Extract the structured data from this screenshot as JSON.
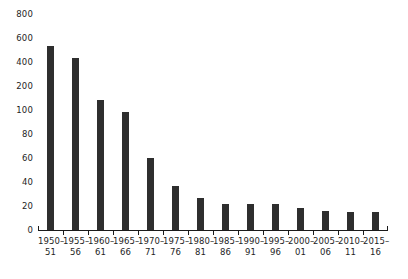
{
  "chart_data": {
    "type": "bar",
    "title": "",
    "subtitle": "",
    "xlabel": "",
    "ylabel": "",
    "legend": [],
    "grid": false,
    "legend_position": "none",
    "bar_color": "#2e2e2e",
    "axis_color": "#1a1a1a",
    "background": "#ffffff",
    "y_axis": {
      "scale": "ordinal-compressed",
      "ticks": [
        0,
        20,
        40,
        60,
        80,
        100,
        200,
        400,
        600,
        800
      ],
      "tick_labels": [
        "0",
        "20",
        "40",
        "60",
        "80",
        "100",
        "200",
        "400",
        "600",
        "800"
      ],
      "ylim": [
        0,
        800
      ]
    },
    "categories": [
      "1950–51",
      "1955–56",
      "1960–61",
      "1965–66",
      "1970–71",
      "1975–76",
      "1980–81",
      "1985–86",
      "1990–91",
      "1995–96",
      "2000–01",
      "2005–06",
      "2010–11",
      "2015–16"
    ],
    "category_lines": [
      {
        "top": "1950–",
        "bottom": "51"
      },
      {
        "top": "1955–",
        "bottom": "56"
      },
      {
        "top": "1960–",
        "bottom": "61"
      },
      {
        "top": "1965–",
        "bottom": "66"
      },
      {
        "top": "1970–",
        "bottom": "71"
      },
      {
        "top": "1975–",
        "bottom": "76"
      },
      {
        "top": "1980–",
        "bottom": "81"
      },
      {
        "top": "1985–",
        "bottom": "86"
      },
      {
        "top": "1990–",
        "bottom": "91"
      },
      {
        "top": "1995–",
        "bottom": "96"
      },
      {
        "top": "2000–",
        "bottom": "01"
      },
      {
        "top": "2005–",
        "bottom": "06"
      },
      {
        "top": "2010–",
        "bottom": "11"
      },
      {
        "top": "2015–",
        "bottom": "16"
      }
    ],
    "values": [
      530,
      430,
      140,
      98,
      60,
      37,
      27,
      22,
      22,
      22,
      18,
      16,
      15,
      15
    ]
  }
}
